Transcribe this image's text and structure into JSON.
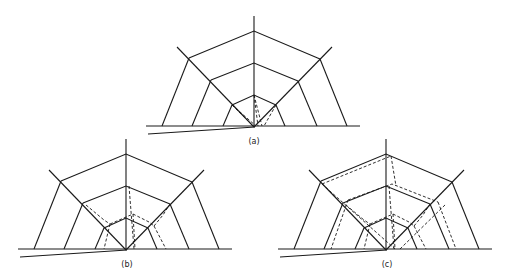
{
  "figure": {
    "panels": [
      {
        "id": "a",
        "label": "(a)",
        "cx": 254,
        "cy": 127,
        "dash_mode": "a"
      },
      {
        "id": "b",
        "label": "(b)",
        "cx": 126,
        "cy": 250,
        "dash_mode": "b"
      },
      {
        "id": "c",
        "label": "(c)",
        "cx": 386,
        "cy": 250,
        "dash_mode": "c"
      }
    ],
    "labels": {
      "a": "(a)",
      "b": "(b)",
      "c": "(c)"
    },
    "stroke_color": "#1a1a1a",
    "background": "#ffffff"
  }
}
